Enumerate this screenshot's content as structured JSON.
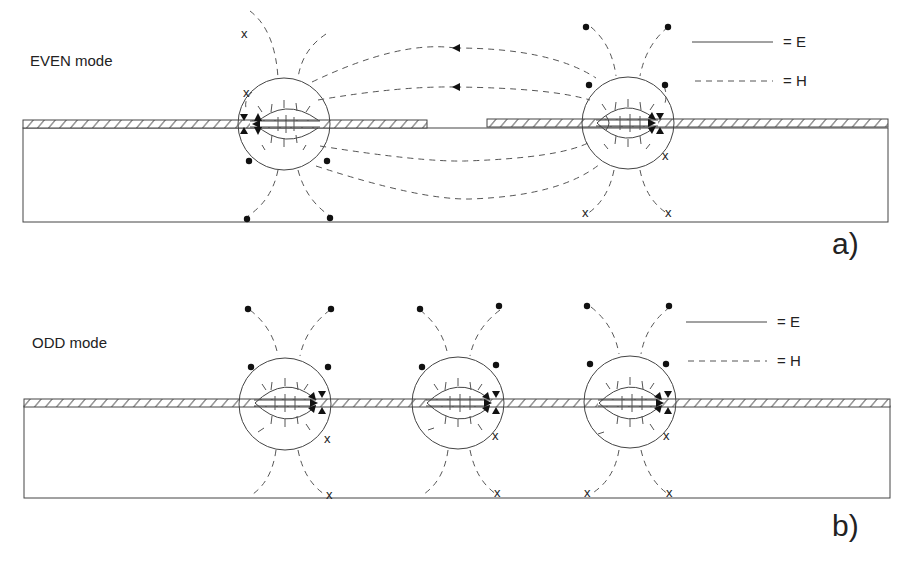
{
  "panels": [
    {
      "id": "a",
      "mode_label": "EVEN mode",
      "panel_label": "a)",
      "legend": [
        {
          "style": "solid",
          "label": "= E"
        },
        {
          "style": "dashed",
          "label": "= H"
        }
      ],
      "slots": 2
    },
    {
      "id": "b",
      "mode_label": "ODD mode",
      "panel_label": "b)",
      "legend": [
        {
          "style": "solid",
          "label": "= E"
        },
        {
          "style": "dashed",
          "label": "= H"
        }
      ],
      "slots": 3
    }
  ],
  "markers": {
    "x_symbol": "x",
    "dot_symbol": "•"
  },
  "colors": {
    "ink": "#444444",
    "background": "#ffffff"
  }
}
